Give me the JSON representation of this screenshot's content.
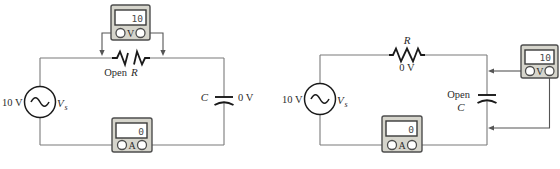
{
  "figure": {
    "left": {
      "source": {
        "voltage": "10 V",
        "name": "V",
        "name_sub": "s"
      },
      "fault": {
        "word": "Open",
        "component": "R"
      },
      "capacitor": {
        "label": "C",
        "reading": "0 V"
      },
      "voltmeter": {
        "display": "10",
        "terminal": "V"
      },
      "ammeter": {
        "display": "0",
        "terminal": "A"
      }
    },
    "right": {
      "source": {
        "voltage": "10 V",
        "name": "V",
        "name_sub": "s"
      },
      "resistor": {
        "label": "R",
        "reading": "0 V"
      },
      "fault": {
        "word": "Open",
        "component": "C"
      },
      "voltmeter": {
        "display": "10",
        "terminal": "V"
      },
      "ammeter": {
        "display": "0",
        "terminal": "A"
      }
    },
    "colors": {
      "wire": "#7a7a7a",
      "symbol": "#1a1a1a",
      "meter_body": "#d6d5cc",
      "meter_border": "#4d4d4d",
      "display_bg": "#ffffff",
      "label_text": "#2b2b2b"
    }
  }
}
